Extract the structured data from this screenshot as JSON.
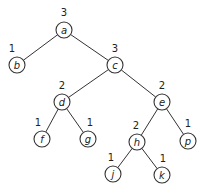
{
  "diagram": {
    "type": "tree",
    "node_radius": 8,
    "nodes": [
      {
        "id": "a",
        "label": "a",
        "height": "3",
        "x": 64,
        "y": 30,
        "hx": 64,
        "hy": 16
      },
      {
        "id": "b",
        "label": "b",
        "height": "1",
        "x": 17,
        "y": 65,
        "hx": 12,
        "hy": 52
      },
      {
        "id": "c",
        "label": "c",
        "height": "3",
        "x": 115,
        "y": 65,
        "hx": 115,
        "hy": 52
      },
      {
        "id": "d",
        "label": "d",
        "height": "2",
        "x": 62,
        "y": 102,
        "hx": 62,
        "hy": 89
      },
      {
        "id": "e",
        "label": "e",
        "height": "2",
        "x": 162,
        "y": 102,
        "hx": 162,
        "hy": 89
      },
      {
        "id": "f",
        "label": "f",
        "height": "1",
        "x": 42,
        "y": 139,
        "hx": 38,
        "hy": 126
      },
      {
        "id": "g",
        "label": "g",
        "height": "1",
        "x": 88,
        "y": 139,
        "hx": 90,
        "hy": 126
      },
      {
        "id": "h",
        "label": "h",
        "height": "2",
        "x": 137,
        "y": 142,
        "hx": 136,
        "hy": 129
      },
      {
        "id": "p",
        "label": "p",
        "height": "1",
        "x": 188,
        "y": 141,
        "hx": 188,
        "hy": 127
      },
      {
        "id": "j",
        "label": "j",
        "height": "1",
        "x": 113,
        "y": 174,
        "hx": 111,
        "hy": 161
      },
      {
        "id": "k",
        "label": "k",
        "height": "1",
        "x": 162,
        "y": 175,
        "hx": 163,
        "hy": 162
      }
    ],
    "edges": [
      [
        "a",
        "b"
      ],
      [
        "a",
        "c"
      ],
      [
        "c",
        "d"
      ],
      [
        "c",
        "e"
      ],
      [
        "d",
        "f"
      ],
      [
        "d",
        "g"
      ],
      [
        "e",
        "h"
      ],
      [
        "e",
        "p"
      ],
      [
        "h",
        "j"
      ],
      [
        "h",
        "k"
      ]
    ]
  }
}
